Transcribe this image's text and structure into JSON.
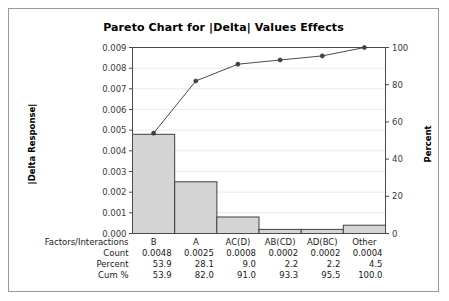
{
  "chart_data": {
    "type": "bar",
    "title": "Pareto Chart for  |Delta|  Values Effects",
    "categories": [
      "B",
      "A",
      "AC(D)",
      "AB(CD)",
      "AD(BC)",
      "Other"
    ],
    "values": [
      0.0048,
      0.0025,
      0.0008,
      0.0002,
      0.0002,
      0.0004
    ],
    "cumulative_percent": [
      53.9,
      82.0,
      91.0,
      93.3,
      95.5,
      100.0
    ],
    "percent": [
      53.9,
      28.1,
      9.0,
      2.2,
      2.2,
      4.5
    ],
    "xlabel": "",
    "ylabel": "|Delta Response|",
    "y2label": "Percent",
    "ylim": [
      0.0,
      0.009
    ],
    "y2lim": [
      0,
      100
    ],
    "yticks": [
      "0.000",
      "0.001",
      "0.002",
      "0.003",
      "0.004",
      "0.005",
      "0.006",
      "0.007",
      "0.008",
      "0.009"
    ],
    "ytick_values": [
      0.0,
      0.001,
      0.002,
      0.003,
      0.004,
      0.005,
      0.006,
      0.007,
      0.008,
      0.009
    ],
    "y2ticks": [
      "0",
      "20",
      "40",
      "60",
      "80",
      "100"
    ],
    "y2tick_values": [
      0,
      20,
      40,
      60,
      80,
      100
    ],
    "grid": true,
    "legend": "none",
    "bar_color": "#d4d4d4",
    "bar_edge_color": "#3f3f3f",
    "line_color": "#4a4a4a",
    "marker_color": "#3f3f3f",
    "table": {
      "row_labels": [
        "Factors/Interactions",
        "Count",
        "Percent",
        "Cum %"
      ],
      "rows": [
        [
          "B",
          "A",
          "AC(D)",
          "AB(CD)",
          "AD(BC)",
          "Other"
        ],
        [
          "0.0048",
          "0.0025",
          "0.0008",
          "0.0002",
          "0.0002",
          "0.0004"
        ],
        [
          "53.9",
          "28.1",
          "9.0",
          "2.2",
          "2.2",
          "4.5"
        ],
        [
          "53.9",
          "82.0",
          "91.0",
          "93.3",
          "95.5",
          "100.0"
        ]
      ]
    }
  }
}
